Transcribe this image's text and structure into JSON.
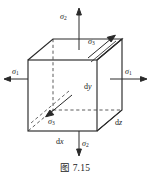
{
  "figure": {
    "caption": "图 7.15",
    "caption_number": "7.15",
    "background_color": "#ffffff",
    "line_color": "#2a2a2a",
    "text_color": "#1a1a1a",
    "stress_labels": {
      "sigma1_left": {
        "symbol": "σ",
        "subscript": "1",
        "direction": "left"
      },
      "sigma1_right": {
        "symbol": "σ",
        "subscript": "1",
        "direction": "right"
      },
      "sigma2_top": {
        "symbol": "σ",
        "subscript": "2",
        "direction": "up"
      },
      "sigma2_bottom": {
        "symbol": "σ",
        "subscript": "2",
        "direction": "down"
      },
      "sigma3_upper": {
        "symbol": "σ",
        "subscript": "3",
        "direction": "up-right"
      },
      "sigma3_lower": {
        "symbol": "σ",
        "subscript": "3",
        "direction": "down-left"
      }
    },
    "dimension_labels": {
      "dx": "dx",
      "dy": "dy",
      "dz": "dz"
    }
  }
}
